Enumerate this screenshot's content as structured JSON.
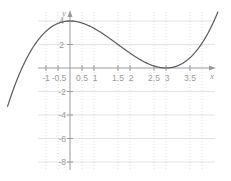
{
  "chart_data": {
    "type": "line",
    "title": "",
    "xlabel": "x",
    "ylabel": "y",
    "xlim": [
      -1.25,
      3.75
    ],
    "ylim": [
      -9.5,
      5.8
    ],
    "grid": true,
    "grid_vertical_style": "dotted",
    "grid_horizontal_style": "solid",
    "legend": "none",
    "xticks": [
      -1,
      -0.5,
      0.5,
      1,
      1.5,
      2,
      2.5,
      3,
      3.5
    ],
    "xtick_labels": [
      "-1",
      "-0.5",
      "0.5",
      "1",
      "1.5",
      "2",
      "2.5",
      "3",
      "3.5"
    ],
    "yticks": [
      4,
      2,
      -2,
      -4,
      -6,
      -8
    ],
    "ytick_labels": [
      "4",
      "2",
      "-2",
      "-4",
      "-6",
      "-8"
    ],
    "series": [
      {
        "name": "cubic",
        "equation": "(x-2)^2 (x+1)",
        "color": "#5a5a5a",
        "roots": [
          -1,
          2
        ],
        "local_max": {
          "x": 0.667,
          "y": 1.185
        },
        "local_min": {
          "x": 2,
          "y": 0
        },
        "x": [
          -1.05,
          -1.0,
          -0.9,
          -0.8,
          -0.7,
          -0.6,
          -0.5,
          -0.4,
          -0.3,
          -0.2,
          -0.1,
          0,
          0.2,
          0.4,
          0.667,
          0.9,
          1.1,
          1.3,
          1.5,
          1.7,
          2.0,
          2.2,
          2.4,
          2.6,
          2.8,
          3.0,
          3.2
        ],
        "y": [
          -0.47,
          0.0,
          0.84,
          1.57,
          2.19,
          2.69,
          3.06,
          3.31,
          3.43,
          3.42,
          3.27,
          4.0,
          1.94,
          2.02,
          1.19,
          1.16,
          0.88,
          0.57,
          0.31,
          0.24,
          0.0,
          0.13,
          0.54,
          1.39,
          2.89,
          5.0,
          7.59
        ]
      }
    ],
    "colors": {
      "curve": "#5a5a5a",
      "axis": "#9a9a9a",
      "grid": "#dcdcdc",
      "tick_text": "#9a9a9a",
      "background": "#ffffff"
    }
  },
  "figure": {
    "axis_x_label": "x",
    "axis_y_label": "y"
  }
}
